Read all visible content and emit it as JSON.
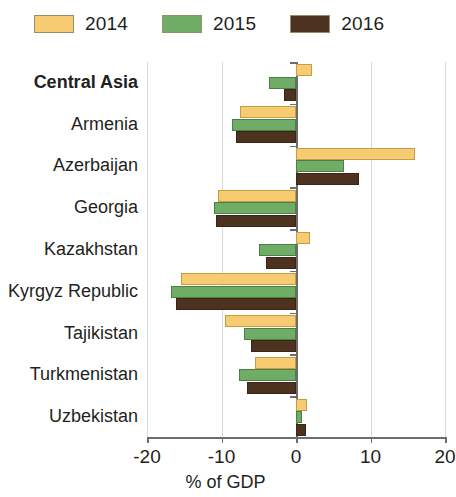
{
  "legend": {
    "entries": [
      {
        "label": "2014",
        "color": "#f6cb72",
        "key": "y2014"
      },
      {
        "label": "2015",
        "color": "#6fac66",
        "key": "y2015"
      },
      {
        "label": "2016",
        "color": "#4e3220",
        "key": "y2016"
      }
    ]
  },
  "axis": {
    "x_label": "% of GDP",
    "ticks": [
      "-20",
      "-10",
      "0",
      "10",
      "20"
    ],
    "tick_values": [
      -20,
      -10,
      0,
      10,
      20
    ],
    "xmin": -20,
    "xmax": 20
  },
  "chart_data": {
    "type": "bar",
    "orientation": "horizontal",
    "title": "",
    "subtitle": "",
    "xlabel": "% of GDP",
    "ylabel": "",
    "xlim": [
      -20,
      20
    ],
    "grid": true,
    "legend_position": "top-left",
    "categories": [
      "Central Asia",
      "Armenia",
      "Azerbaijan",
      "Georgia",
      "Kazakhstan",
      "Kyrgyz Republic",
      "Tajikistan",
      "Turkmenistan",
      "Uzbekistan"
    ],
    "emphasized_categories": [
      "Central Asia"
    ],
    "series": [
      {
        "name": "2014",
        "color": "#f6cb72",
        "values": [
          2.2,
          -7.5,
          16.0,
          -10.5,
          1.9,
          -15.5,
          -9.5,
          -5.5,
          1.5
        ]
      },
      {
        "name": "2015",
        "color": "#6fac66",
        "values": [
          -3.6,
          -8.6,
          6.5,
          -11.0,
          -5.0,
          -16.8,
          -7.0,
          -7.6,
          0.8
        ]
      },
      {
        "name": "2016",
        "color": "#4e3220",
        "values": [
          -1.6,
          -8.0,
          8.5,
          -10.8,
          -4.0,
          -16.1,
          -6.1,
          -6.6,
          1.3
        ]
      }
    ]
  }
}
